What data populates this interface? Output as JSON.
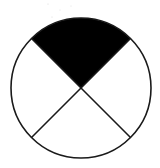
{
  "diagram": {
    "type": "fraction-circle",
    "total_parts": 4,
    "shaded_parts": 1,
    "shaded_position": "top",
    "fraction_label": "1/4",
    "colors": {
      "background": "#ffffff",
      "outline": "#1a1a1a",
      "shade": "#000000",
      "unshaded": "#ffffff"
    },
    "geometry": {
      "cx": 81,
      "cy": 88,
      "r": 70,
      "stroke_width": 1.6
    }
  }
}
